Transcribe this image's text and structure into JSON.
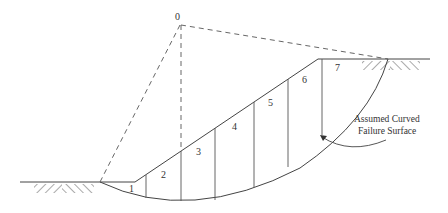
{
  "diagram": {
    "center_label": "0",
    "slice_labels": [
      "1",
      "2",
      "3",
      "4",
      "5",
      "6",
      "7"
    ],
    "annotation": {
      "line1": "Assumed Curved",
      "line2": "Failure Surface"
    },
    "colors": {
      "line": "#444444",
      "text": "#333333",
      "background": "#ffffff"
    }
  }
}
